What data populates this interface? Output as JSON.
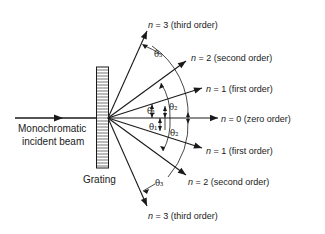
{
  "figure": {
    "incident_beam_label_line1": "Monochromatic",
    "incident_beam_label_line2": "incident beam",
    "grating_label": "Grating",
    "orders": [
      {
        "id": "n3-up",
        "n_symbol": "n",
        "eq": " = 3",
        "desc": "(third order)"
      },
      {
        "id": "n2-up",
        "n_symbol": "n",
        "eq": " = 2",
        "desc": "(second order)"
      },
      {
        "id": "n1-up",
        "n_symbol": "n",
        "eq": " = 1",
        "desc": "(first order)"
      },
      {
        "id": "n0",
        "n_symbol": "n",
        "eq": " = 0",
        "desc": "(zero order)"
      },
      {
        "id": "n1-down",
        "n_symbol": "n",
        "eq": " = 1",
        "desc": "(first order)"
      },
      {
        "id": "n2-down",
        "n_symbol": "n",
        "eq": " = 2",
        "desc": "(second order)"
      },
      {
        "id": "n3-down",
        "n_symbol": "n",
        "eq": " = 3",
        "desc": "(third order)"
      }
    ],
    "angles": {
      "theta1": "θ₁",
      "theta2": "θ₂",
      "theta3": "θ₃"
    }
  }
}
